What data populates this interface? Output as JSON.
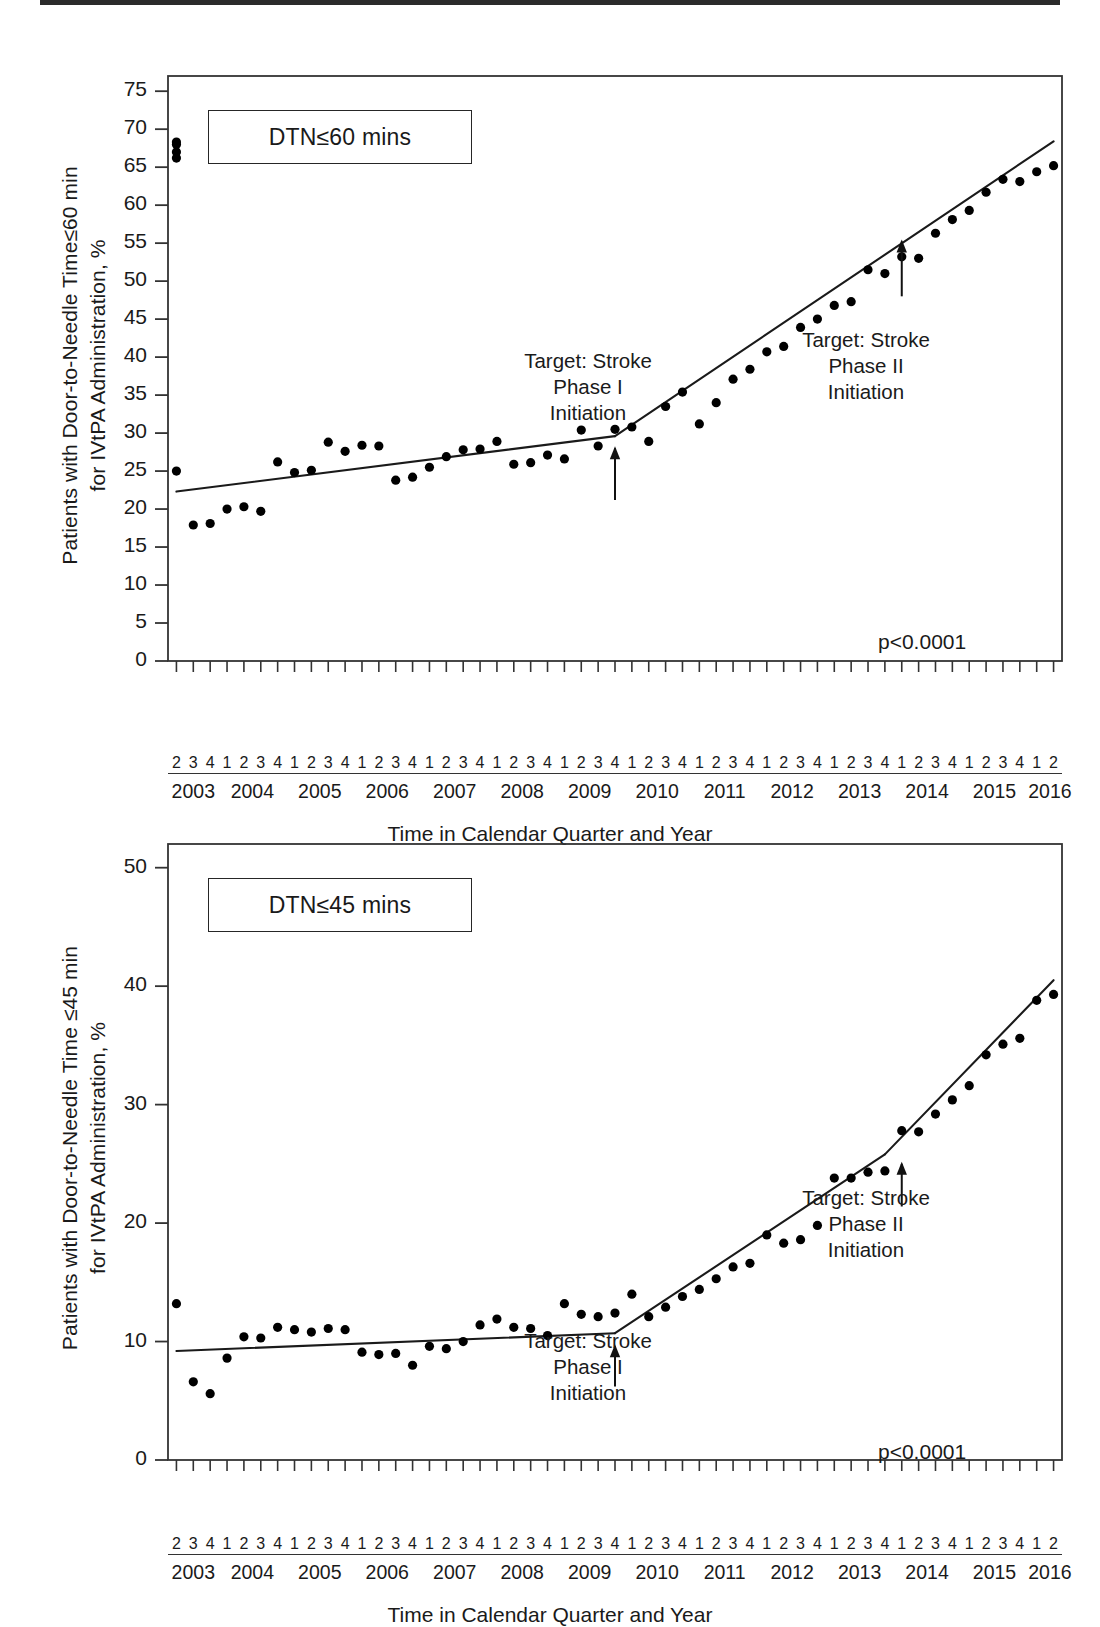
{
  "document": {
    "type": "scientific-figure",
    "panel_count": 2
  },
  "x_axis": {
    "title": "Time in Calendar Quarter and Year",
    "years": [
      "2003",
      "2004",
      "2005",
      "2006",
      "2007",
      "2008",
      "2009",
      "2010",
      "2011",
      "2012",
      "2013",
      "2014",
      "2015",
      "2016"
    ],
    "year_quarters": [
      [
        "2",
        "3",
        "4"
      ],
      [
        "1",
        "2",
        "3",
        "4"
      ],
      [
        "1",
        "2",
        "3",
        "4"
      ],
      [
        "1",
        "2",
        "3",
        "4"
      ],
      [
        "1",
        "2",
        "3",
        "4"
      ],
      [
        "1",
        "2",
        "3",
        "4"
      ],
      [
        "1",
        "2",
        "3",
        "4"
      ],
      [
        "1",
        "2",
        "3",
        "4"
      ],
      [
        "1",
        "2",
        "3",
        "4"
      ],
      [
        "1",
        "2",
        "3",
        "4"
      ],
      [
        "1",
        "2",
        "3",
        "4"
      ],
      [
        "1",
        "2",
        "3",
        "4"
      ],
      [
        "1",
        "2",
        "3",
        "4"
      ],
      [
        "1",
        "2"
      ]
    ],
    "tick_labels": [
      "2003Q2",
      "2003Q3",
      "2003Q4",
      "2004Q1",
      "2004Q2",
      "2004Q3",
      "2004Q4",
      "2005Q1",
      "2005Q2",
      "2005Q3",
      "2005Q4",
      "2006Q1",
      "2006Q2",
      "2006Q3",
      "2006Q4",
      "2007Q1",
      "2007Q2",
      "2007Q3",
      "2007Q4",
      "2008Q1",
      "2008Q2",
      "2008Q3",
      "2008Q4",
      "2009Q1",
      "2009Q2",
      "2009Q3",
      "2009Q4",
      "2010Q1",
      "2010Q2",
      "2010Q3",
      "2010Q4",
      "2011Q1",
      "2011Q2",
      "2011Q3",
      "2011Q4",
      "2012Q1",
      "2012Q2",
      "2012Q3",
      "2012Q4",
      "2013Q1",
      "2013Q2",
      "2013Q3",
      "2013Q4",
      "2014Q1",
      "2014Q2",
      "2014Q3",
      "2014Q4",
      "2015Q1",
      "2015Q2",
      "2015Q3",
      "2015Q4",
      "2016Q1",
      "2016Q2"
    ]
  },
  "chart_data": [
    {
      "id": "dtn-60",
      "type": "scatter",
      "title": "DTN≤60 mins",
      "xlabel": "Time in Calendar Quarter and Year",
      "ylabel": "Patients with Door-to-Needle Time≤60 min for IVtPA Administration, %",
      "ylabel_line1": "Patients with Door-to-Needle Time≤60 min",
      "ylabel_line2": "for IVtPA Administration, %",
      "ylim": [
        0,
        77
      ],
      "yticks": [
        0,
        5,
        10,
        15,
        20,
        25,
        30,
        35,
        40,
        45,
        50,
        55,
        60,
        65,
        70,
        75
      ],
      "grid": false,
      "legend": "none",
      "pvalue": "p<0.0001",
      "x": [
        "2003Q2",
        "2003Q3",
        "2003Q4",
        "2004Q1",
        "2004Q2",
        "2004Q3",
        "2004Q4",
        "2005Q1",
        "2005Q2",
        "2005Q3",
        "2005Q4",
        "2006Q1",
        "2006Q2",
        "2006Q3",
        "2006Q4",
        "2007Q1",
        "2007Q2",
        "2007Q3",
        "2007Q4",
        "2008Q1",
        "2008Q2",
        "2008Q3",
        "2008Q4",
        "2009Q1",
        "2009Q2",
        "2009Q3",
        "2009Q4",
        "2010Q1",
        "2010Q2",
        "2010Q3",
        "2010Q4",
        "2011Q1",
        "2011Q2",
        "2011Q3",
        "2011Q4",
        "2012Q1",
        "2012Q2",
        "2012Q3",
        "2012Q4",
        "2013Q1",
        "2013Q2",
        "2013Q3",
        "2013Q4",
        "2014Q1",
        "2014Q2",
        "2014Q3",
        "2014Q4",
        "2015Q1",
        "2015Q2",
        "2015Q3",
        "2015Q4",
        "2016Q1",
        "2016Q2"
      ],
      "values": [
        25.0,
        17.9,
        18.1,
        20.0,
        20.3,
        19.7,
        26.2,
        24.8,
        25.1,
        28.8,
        27.6,
        28.4,
        28.3,
        23.8,
        24.2,
        25.5,
        26.9,
        27.8,
        27.9,
        28.9,
        25.9,
        26.1,
        27.1,
        26.6,
        30.4,
        28.3,
        30.5,
        30.8,
        28.9,
        33.5,
        35.4,
        31.2,
        34.0,
        37.1,
        38.4,
        40.7,
        41.4,
        43.9,
        45.0,
        46.8,
        47.3,
        51.5,
        51.0,
        53.2,
        53.0,
        56.3,
        58.1,
        59.3,
        61.7,
        63.4,
        63.1,
        64.4,
        65.2,
        66.2,
        67.0,
        68.0,
        68.3
      ],
      "trend_segments": [
        {
          "name": "pre-phase-I",
          "x_start": "2003Q2",
          "x_end": "2009Q4",
          "y_start": 22.3,
          "y_end": 29.6
        },
        {
          "name": "phase-I-to-phase-II",
          "x_start": "2009Q4",
          "x_end": "2016Q2",
          "y_start": 29.6,
          "y_end": 68.4
        }
      ],
      "annotations": [
        {
          "name": "target-stroke-phase-i",
          "lines": [
            "Target: Stroke",
            "Phase I",
            "Initiation"
          ],
          "at_x": "2009Q4",
          "arrow": "up"
        },
        {
          "name": "target-stroke-phase-ii",
          "lines": [
            "Target: Stroke",
            "Phase II",
            "Initiation"
          ],
          "at_x": "2014Q1",
          "arrow": "up"
        }
      ]
    },
    {
      "id": "dtn-45",
      "type": "scatter",
      "title": "DTN≤45 mins",
      "xlabel": "Time in Calendar Quarter and Year",
      "ylabel": "Patients with Door-to-Needle Time ≤45 min for IVtPA Administration, %",
      "ylabel_line1": "Patients with Door-to-Needle Time ≤45 min",
      "ylabel_line2": "for IVtPA Administration, %",
      "ylim": [
        0,
        52
      ],
      "yticks": [
        0,
        10,
        20,
        30,
        40,
        50
      ],
      "grid": false,
      "legend": "none",
      "pvalue": "p<0.0001",
      "x": [
        "2003Q2",
        "2003Q3",
        "2003Q4",
        "2004Q1",
        "2004Q2",
        "2004Q3",
        "2004Q4",
        "2005Q1",
        "2005Q2",
        "2005Q3",
        "2005Q4",
        "2006Q1",
        "2006Q2",
        "2006Q3",
        "2006Q4",
        "2007Q1",
        "2007Q2",
        "2007Q3",
        "2007Q4",
        "2008Q1",
        "2008Q2",
        "2008Q3",
        "2008Q4",
        "2009Q1",
        "2009Q2",
        "2009Q3",
        "2009Q4",
        "2010Q1",
        "2010Q2",
        "2010Q3",
        "2010Q4",
        "2011Q1",
        "2011Q2",
        "2011Q3",
        "2011Q4",
        "2012Q1",
        "2012Q2",
        "2012Q3",
        "2012Q4",
        "2013Q1",
        "2013Q2",
        "2013Q3",
        "2013Q4",
        "2014Q1",
        "2014Q2",
        "2014Q3",
        "2014Q4",
        "2015Q1",
        "2015Q2",
        "2015Q3",
        "2015Q4",
        "2016Q1",
        "2016Q2"
      ],
      "values": [
        13.2,
        6.6,
        5.6,
        8.6,
        10.4,
        10.3,
        11.2,
        11.0,
        10.8,
        11.1,
        11.0,
        9.1,
        8.9,
        9.0,
        8.0,
        9.6,
        9.4,
        10.0,
        11.4,
        11.9,
        11.2,
        11.1,
        10.5,
        13.2,
        12.3,
        12.1,
        12.4,
        14.0,
        12.1,
        12.9,
        13.8,
        14.4,
        15.3,
        16.3,
        16.6,
        19.0,
        18.3,
        18.6,
        19.8,
        23.8,
        23.8,
        24.3,
        24.4,
        27.8,
        27.7,
        29.2,
        30.4,
        31.6,
        34.2,
        35.1,
        35.6,
        38.8,
        39.3
      ],
      "trend_segments": [
        {
          "name": "pre-phase-I",
          "x_start": "2003Q2",
          "x_end": "2009Q4",
          "y_start": 9.2,
          "y_end": 10.7
        },
        {
          "name": "phase-I-to-phase-II",
          "x_start": "2009Q4",
          "x_end": "2013Q4",
          "y_start": 10.7,
          "y_end": 25.8
        },
        {
          "name": "post-phase-II",
          "x_start": "2013Q4",
          "x_end": "2016Q2",
          "y_start": 25.8,
          "y_end": 40.5
        }
      ],
      "annotations": [
        {
          "name": "target-stroke-phase-i",
          "lines": [
            "Target: Stroke",
            "Phase I",
            "Initiation"
          ],
          "at_x": "2009Q4",
          "arrow": "up"
        },
        {
          "name": "target-stroke-phase-ii",
          "lines": [
            "Target: Stroke",
            "Phase II",
            "Initiation"
          ],
          "at_x": "2014Q1",
          "arrow": "up"
        }
      ]
    }
  ],
  "colors": {
    "ink": "#1a1a1a",
    "axis": "#333333",
    "marker": "#000000",
    "background": "#ffffff"
  }
}
